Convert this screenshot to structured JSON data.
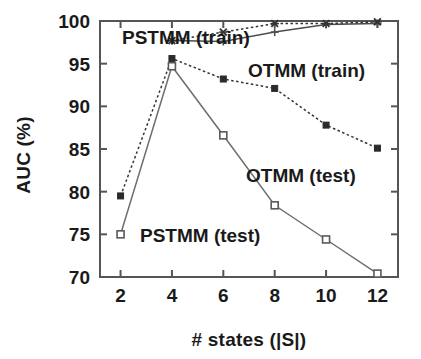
{
  "chart_data": {
    "type": "line",
    "title": "",
    "xlabel": "# states (|S|)",
    "ylabel": "AUC (%)",
    "x": [
      2,
      4,
      6,
      8,
      10,
      12
    ],
    "xlim": [
      1.2,
      12.8
    ],
    "ylim": [
      70,
      100
    ],
    "xticks": [
      "2",
      "4",
      "6",
      "8",
      "10",
      "12"
    ],
    "yticks": [
      "70",
      "75",
      "80",
      "85",
      "90",
      "95",
      "100"
    ],
    "ytick_values": [
      70,
      75,
      80,
      85,
      90,
      95,
      100
    ],
    "grid": false,
    "legend_position": "inline-annotations",
    "series": [
      {
        "name": "PSTMM (train)",
        "x": [
          4,
          6,
          8,
          10,
          12
        ],
        "values": [
          97.7,
          97.6,
          98.7,
          99.6,
          99.7
        ],
        "line_style": "solid",
        "marker": "plus",
        "color": "#4d4d4d"
      },
      {
        "name": "OTMM (train)",
        "x": [
          4,
          6,
          8,
          10,
          12
        ],
        "values": [
          97.7,
          98.7,
          99.7,
          99.7,
          99.9
        ],
        "line_style": "dotted",
        "marker": "cross",
        "color": "#333333"
      },
      {
        "name": "OTMM (test)",
        "x": [
          2,
          4,
          6,
          8,
          10,
          12
        ],
        "values": [
          79.5,
          95.6,
          93.2,
          92.1,
          87.8,
          85.1
        ],
        "line_style": "dotted",
        "marker": "square-filled",
        "color": "#333333"
      },
      {
        "name": "PSTMM (test)",
        "x": [
          2,
          4,
          6,
          8,
          10,
          12
        ],
        "values": [
          75.0,
          94.7,
          86.6,
          78.4,
          74.4,
          70.4
        ],
        "line_style": "solid",
        "marker": "square-open",
        "color": "#6e6e6e"
      }
    ],
    "annotations": [
      {
        "text": "PSTMM (train)",
        "x_px": 122,
        "y_px": 44
      },
      {
        "text": "OTMM (train)",
        "x_px": 248,
        "y_px": 77
      },
      {
        "text": "OTMM (test)",
        "x_px": 246,
        "y_px": 182
      },
      {
        "text": "PSTMM (test)",
        "x_px": 140,
        "y_px": 242
      }
    ]
  }
}
